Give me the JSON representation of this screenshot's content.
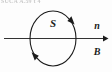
{
  "figure": {
    "type": "physics-flux-diagram",
    "background_color": "#fdfdfd",
    "stroke_color": "#1b1b1b",
    "clipped_header_text": "SUCA A.59 t 4",
    "surface_label": "S",
    "normal_vector_label": "n",
    "field_vector_label": "B",
    "loop": {
      "name": "surface-boundary-loop",
      "shape": "ellipse",
      "center_x": 53,
      "center_y": 38,
      "radius_x": 23,
      "radius_y": 27,
      "orientation_arrows": 2,
      "arrow_positions": [
        "upper-right",
        "lower-left"
      ]
    },
    "vector_arrow": {
      "name": "field-direction-arrow",
      "x_start": 4,
      "x_end": 107,
      "y": 38,
      "direction": "right"
    },
    "labels": [
      {
        "id": "surface",
        "text": "S",
        "x": 53,
        "y": 26
      },
      {
        "id": "normal",
        "text": "n",
        "x": 97,
        "y": 28
      },
      {
        "id": "field",
        "text": "B",
        "x": 97,
        "y": 53
      }
    ]
  }
}
